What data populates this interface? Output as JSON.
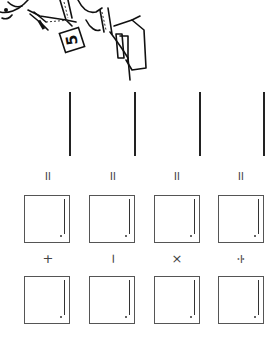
{
  "worksheet": {
    "orientation": "rotated 90° clockwise",
    "illustration": {
      "description": "cartoon child holding a number card next to stacked boxes",
      "card_number": "5"
    },
    "equals_symbol": "=",
    "columns": [
      {
        "operator": "+",
        "operator_name": "plus"
      },
      {
        "operator": "−",
        "operator_name": "minus"
      },
      {
        "operator": "×",
        "operator_name": "times"
      },
      {
        "operator": "÷",
        "operator_name": "divide"
      }
    ]
  }
}
